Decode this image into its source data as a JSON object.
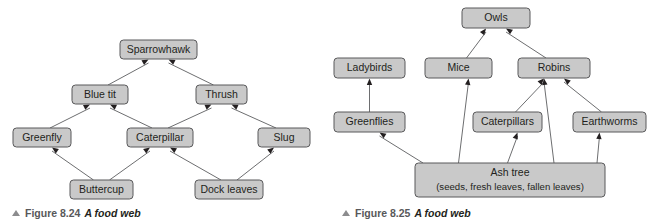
{
  "figures": [
    {
      "id": "figure-8-24",
      "caption_marker": "triangle-up-icon",
      "caption_figno": "Figure 8.24",
      "caption_title": "A food web",
      "nodes": [
        {
          "key": "sparrowhawk",
          "label": "Sparrowhawk",
          "x": 120,
          "y": 40,
          "w": 77,
          "h": 19
        },
        {
          "key": "blue_tit",
          "label": "Blue tit",
          "x": 72,
          "y": 85,
          "w": 56,
          "h": 19
        },
        {
          "key": "thrush",
          "label": "Thrush",
          "x": 196,
          "y": 85,
          "w": 51,
          "h": 19
        },
        {
          "key": "greenfly",
          "label": "Greenfly",
          "x": 13,
          "y": 128,
          "w": 58,
          "h": 19
        },
        {
          "key": "caterpillar",
          "label": "Caterpillar",
          "x": 127,
          "y": 128,
          "w": 66,
          "h": 19
        },
        {
          "key": "slug",
          "label": "Slug",
          "x": 258,
          "y": 128,
          "w": 52,
          "h": 19
        },
        {
          "key": "buttercup",
          "label": "Buttercup",
          "x": 70,
          "y": 180,
          "w": 63,
          "h": 19
        },
        {
          "key": "dock_leaves",
          "label": "Dock leaves",
          "x": 195,
          "y": 180,
          "w": 68,
          "h": 19
        }
      ],
      "edges": [
        {
          "from": "blue_tit",
          "to": "sparrowhawk"
        },
        {
          "from": "thrush",
          "to": "sparrowhawk"
        },
        {
          "from": "greenfly",
          "to": "blue_tit"
        },
        {
          "from": "caterpillar",
          "to": "blue_tit"
        },
        {
          "from": "caterpillar",
          "to": "thrush"
        },
        {
          "from": "slug",
          "to": "thrush"
        },
        {
          "from": "buttercup",
          "to": "greenfly"
        },
        {
          "from": "buttercup",
          "to": "caterpillar"
        },
        {
          "from": "dock_leaves",
          "to": "caterpillar"
        },
        {
          "from": "dock_leaves",
          "to": "slug"
        }
      ]
    },
    {
      "id": "figure-8-25",
      "caption_marker": "triangle-up-icon",
      "caption_figno": "Figure 8.25",
      "caption_title": "A food web",
      "nodes": [
        {
          "key": "owls",
          "label": "Owls",
          "x": 132,
          "y": 8,
          "w": 68,
          "h": 20
        },
        {
          "key": "ladybirds",
          "label": "Ladybirds",
          "x": 4,
          "y": 58,
          "w": 71,
          "h": 20
        },
        {
          "key": "mice",
          "label": "Mice",
          "x": 95,
          "y": 58,
          "w": 67,
          "h": 20
        },
        {
          "key": "robins",
          "label": "Robins",
          "x": 188,
          "y": 58,
          "w": 72,
          "h": 20
        },
        {
          "key": "greenflies",
          "label": "Greenflies",
          "x": 4,
          "y": 112,
          "w": 71,
          "h": 20
        },
        {
          "key": "caterpillars",
          "label": "Caterpillars",
          "x": 143,
          "y": 112,
          "w": 69,
          "h": 20
        },
        {
          "key": "earthworms",
          "label": "Earthworms",
          "x": 243,
          "y": 112,
          "w": 73,
          "h": 20
        },
        {
          "key": "ash_tree",
          "label": "Ash tree",
          "label2": "(seeds, fresh leaves, fallen leaves)",
          "x": 85,
          "y": 163,
          "w": 190,
          "h": 34
        }
      ],
      "edges": [
        {
          "from": "mice",
          "to": "owls"
        },
        {
          "from": "robins",
          "to": "owls"
        },
        {
          "from": "greenflies",
          "to": "ladybirds"
        },
        {
          "from": "caterpillars",
          "to": "robins"
        },
        {
          "from": "earthworms",
          "to": "robins"
        },
        {
          "from": "ash_tree",
          "to": "greenflies"
        },
        {
          "from": "ash_tree",
          "to": "mice"
        },
        {
          "from": "ash_tree",
          "to": "caterpillars"
        },
        {
          "from": "ash_tree",
          "to": "robins"
        },
        {
          "from": "ash_tree",
          "to": "earthworms"
        }
      ]
    }
  ],
  "colors": {
    "node_fill": "#c9c9c9",
    "node_stroke": "#58585a",
    "edge_stroke": "#6d6e70",
    "text": "#231f20",
    "background": "#ffffff"
  }
}
